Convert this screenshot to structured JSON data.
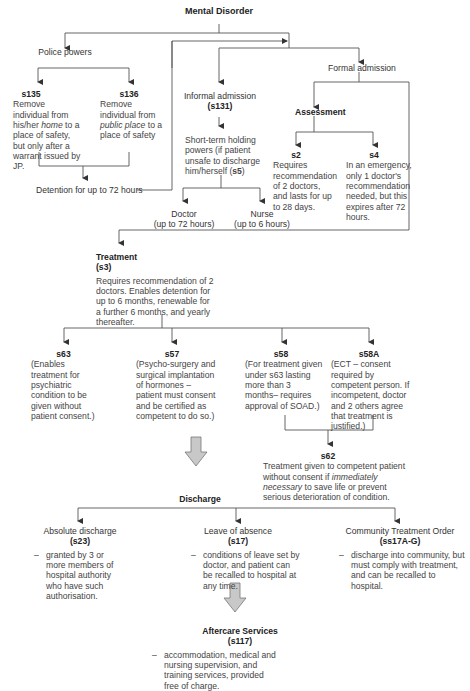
{
  "title": "Mental Disorder",
  "police_powers": {
    "label": "Police powers",
    "s135": {
      "code": "s135",
      "text_a": "Remove individual from his/her ",
      "text_em": "home",
      "text_b": " to a place of safety, but only after a warrant issued by JP."
    },
    "s136": {
      "code": "s136",
      "text_a": "Remove individual from ",
      "text_em": "public place",
      "text_b": " to a place of safety"
    },
    "detention": "Detention for up to 72 hours"
  },
  "informal": {
    "label": "Informal admission",
    "code": "(s131)",
    "holding_text": "Short-term holding powers (if patient unsafe to discharge him/herself (",
    "holding_code": "s5",
    "holding_end": ")",
    "doctor": {
      "label": "Doctor",
      "limit": "(up to 72 hours)"
    },
    "nurse": {
      "label": "Nurse",
      "limit": "(up to 6 hours)"
    }
  },
  "formal": {
    "label": "Formal admission",
    "assessment": "Assessment",
    "s2": {
      "code": "s2",
      "text": "Requires recommendation of 2 doctors, and lasts for up to 28 days."
    },
    "s4": {
      "code": "s4",
      "text": "In an emergency, only 1 doctor's recommendation needed, but this expires after 72 hours."
    }
  },
  "treatment": {
    "label": "Treatment",
    "code": "(s3)",
    "text": "Requires recommendation of 2 doctors. Enables detention for up to 6 months, renewable for a further 6 months, and yearly thereafter.",
    "sections": [
      {
        "code": "s63",
        "text": "(Enables treatment for psychiatric condition to be given without patient consent.)"
      },
      {
        "code": "s57",
        "text": "(Psycho-surgery and surgical implantation of hormones – patient must consent and be certified as competent to do so.)"
      },
      {
        "code": "s58",
        "text": "(For treatment given under s63 lasting more than 3 months– requires approval of SOAD.)"
      },
      {
        "code": "s58A",
        "text": "(ECT – consent required by competent person. If incompetent, doctor and 2 others agree that treatment is justified.)"
      }
    ],
    "s62": {
      "code": "s62",
      "text_a": "Treatment given to competent patient without consent if ",
      "text_em": "immediately necessary",
      "text_b": " to save life or prevent serious deterioration of condition."
    }
  },
  "discharge": {
    "label": "Discharge",
    "options": [
      {
        "label": "Absolute discharge",
        "code": "(s23)",
        "text": "granted by 3 or more members of hospital authority who have such authorisation."
      },
      {
        "label": "Leave of absence",
        "code": "(s17)",
        "text": "conditions of leave set by doctor, and patient can be recalled to hospital at any time."
      },
      {
        "label": "Community Treatment Order",
        "code": "(ss17A-G)",
        "text": "discharge into community, but must comply with treatment, and can be recalled to hospital."
      }
    ]
  },
  "aftercare": {
    "label": "Aftercare Services",
    "code": "(s117)",
    "text": "accommodation, medical and nursing supervision, and training services, provided free of charge."
  },
  "dash": "–",
  "colors": {
    "line": "#555555",
    "arrow_fill": "#c8c8c8",
    "arrow_stroke": "#777777"
  }
}
